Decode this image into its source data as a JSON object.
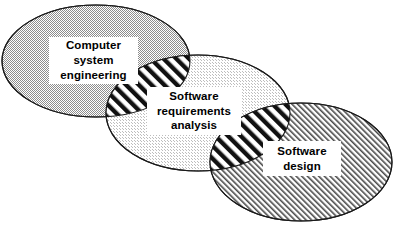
{
  "diagram": {
    "type": "venn-overlap",
    "background_color": "#ffffff",
    "outline_color": "#1a1a1a",
    "overlap_fill": "bold-diagonal-stripes",
    "ellipses": [
      {
        "id": "computer-system-engineering",
        "label_lines": [
          "Computer",
          "system",
          "engineering"
        ],
        "fill": "fine-checker-gray",
        "fill_color": "#a8a8a8",
        "cx": 96,
        "cy": 61,
        "rx": 94,
        "ry": 56
      },
      {
        "id": "software-requirements-analysis",
        "label_lines": [
          "Software",
          "requirements",
          "analysis"
        ],
        "fill": "fine-checker-light",
        "fill_color": "#e4e4e4",
        "cx": 198,
        "cy": 113,
        "rx": 92,
        "ry": 58
      },
      {
        "id": "software-design",
        "label_lines": [
          "Software",
          "design"
        ],
        "fill": "fine-diagonal-hatch",
        "fill_color": "#555555",
        "cx": 301,
        "cy": 162,
        "rx": 91,
        "ry": 59
      }
    ]
  }
}
